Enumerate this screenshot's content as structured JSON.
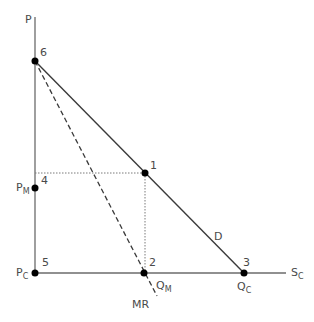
{
  "diagram": {
    "axes": {
      "y_label": "P",
      "x_supply_label": {
        "main": "S",
        "sub": "C"
      }
    },
    "price_labels": {
      "monopoly": {
        "main": "P",
        "sub": "M"
      },
      "competitive": {
        "main": "P",
        "sub": "C"
      }
    },
    "quantity_labels": {
      "monopoly": {
        "main": "Q",
        "sub": "M"
      },
      "competitive": {
        "main": "Q",
        "sub": "C"
      }
    },
    "curve_labels": {
      "demand": "D",
      "marginal_revenue": "MR"
    },
    "points": [
      {
        "id": "1",
        "label": "1",
        "x": 145,
        "y": 173
      },
      {
        "id": "2",
        "label": "2",
        "x": 144,
        "y": 273
      },
      {
        "id": "3",
        "label": "3",
        "x": 244,
        "y": 273
      },
      {
        "id": "4",
        "label": "4",
        "x": 35,
        "y": 188
      },
      {
        "id": "5",
        "label": "5",
        "x": 35,
        "y": 273
      },
      {
        "id": "6",
        "label": "6",
        "x": 35,
        "y": 61
      }
    ]
  }
}
